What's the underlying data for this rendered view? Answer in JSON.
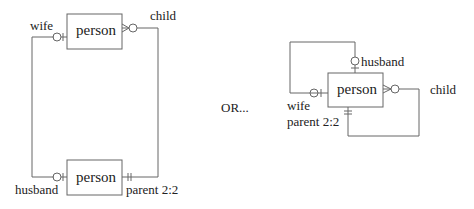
{
  "diagram_left": {
    "top_entity": "person",
    "bottom_entity": "person",
    "labels": {
      "wife": "wife",
      "child": "child",
      "husband": "husband",
      "parent": "parent 2:2"
    }
  },
  "separator": "OR...",
  "diagram_right": {
    "entity": "person",
    "labels": {
      "husband": "husband",
      "wife": "wife",
      "child": "child",
      "parent": "parent 2:2"
    }
  },
  "colors": {
    "stroke": "#666666",
    "text": "#222222"
  }
}
